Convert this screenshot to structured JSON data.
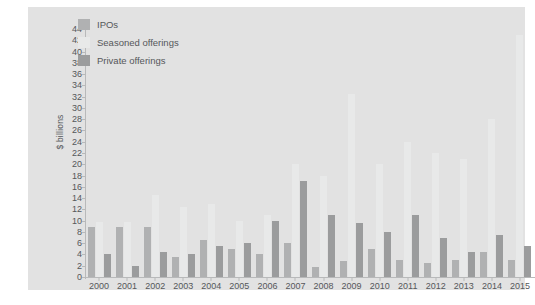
{
  "chart_data": {
    "type": "bar",
    "title": "",
    "subtitle": "",
    "xlabel": "",
    "ylabel": "$ billions",
    "ylim": [
      0,
      44
    ],
    "ytick_step": 2,
    "yticks": [
      0,
      2,
      4,
      6,
      8,
      10,
      12,
      14,
      16,
      18,
      20,
      22,
      24,
      26,
      28,
      30,
      32,
      34,
      36,
      38,
      40,
      42,
      44
    ],
    "grid": false,
    "legend_position": "top-left",
    "background_color": "#e2e2e2",
    "page_background": "#ffffff",
    "axis_color": "#b8b9ba",
    "text_color": "#55575a",
    "categories": [
      "2000",
      "2001",
      "2002",
      "2003",
      "2004",
      "2005",
      "2006",
      "2007",
      "2008",
      "2009",
      "2010",
      "2011",
      "2012",
      "2013",
      "2014",
      "2015"
    ],
    "series": [
      {
        "name": "IPOs",
        "color": "#b0b1b2",
        "values": [
          8.8,
          8.8,
          8.8,
          3.5,
          6.5,
          5.0,
          4.0,
          6.0,
          1.8,
          2.8,
          5.0,
          3.0,
          2.5,
          3.0,
          4.5,
          3.0
        ]
      },
      {
        "name": "Seasoned offerings",
        "color": "#e8e9e9",
        "values": [
          9.8,
          9.8,
          14.5,
          12.5,
          13.0,
          10.0,
          11.0,
          20.0,
          18.0,
          32.5,
          20.0,
          24.0,
          22.0,
          21.0,
          28.0,
          43.0
        ]
      },
      {
        "name": "Private offerings",
        "color": "#9b9c9d",
        "values": [
          4.0,
          2.0,
          4.5,
          4.0,
          5.5,
          6.0,
          10.0,
          17.0,
          11.0,
          9.5,
          8.0,
          11.0,
          7.0,
          4.5,
          7.5,
          5.5
        ]
      }
    ]
  },
  "legend": {
    "items": [
      {
        "label": "IPOs",
        "color": "#b0b1b2"
      },
      {
        "label": "Seasoned offerings",
        "color": "#e8e9e9"
      },
      {
        "label": "Private offerings",
        "color": "#9b9c9d"
      }
    ]
  }
}
